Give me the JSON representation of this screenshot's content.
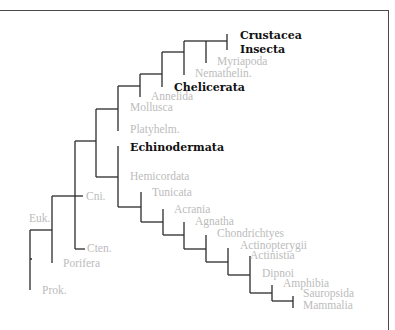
{
  "diagram": {
    "type": "phylogenetic-tree",
    "colors": {
      "line": "#2b2b2b",
      "highlight_label": "#111111",
      "faded_label": "#bcbcbc",
      "frame": "#4a4a4a"
    },
    "labels": [
      {
        "id": "crustacea",
        "text": "Crustacea",
        "x": 240,
        "y": 35,
        "bold": true
      },
      {
        "id": "insecta",
        "text": "Insecta",
        "x": 240,
        "y": 49,
        "bold": true
      },
      {
        "id": "myriapoda",
        "text": "Myriapoda",
        "x": 217,
        "y": 62,
        "bold": false
      },
      {
        "id": "nemathelin",
        "text": "Nemathelin.",
        "x": 195,
        "y": 74,
        "bold": false
      },
      {
        "id": "chelicerata",
        "text": "Chelicerata",
        "x": 174,
        "y": 87,
        "bold": true
      },
      {
        "id": "annelida",
        "text": "Annelida",
        "x": 151,
        "y": 97,
        "bold": false
      },
      {
        "id": "mollusca",
        "text": "Mollusca",
        "x": 130,
        "y": 108,
        "bold": false
      },
      {
        "id": "platyhelm",
        "text": "Platyhelm.",
        "x": 130,
        "y": 130,
        "bold": false
      },
      {
        "id": "echinodermata",
        "text": "Echinodermata",
        "x": 130,
        "y": 147,
        "bold": true
      },
      {
        "id": "hemicordata",
        "text": "Hemicordata",
        "x": 130,
        "y": 177,
        "bold": false
      },
      {
        "id": "tunicata",
        "text": "Tunicata",
        "x": 152,
        "y": 193,
        "bold": false
      },
      {
        "id": "acrania",
        "text": "Acrania",
        "x": 174,
        "y": 210,
        "bold": false
      },
      {
        "id": "agnatha",
        "text": "Agnatha",
        "x": 195,
        "y": 222,
        "bold": false
      },
      {
        "id": "chondrichtyes",
        "text": "Chondrichtyes",
        "x": 217,
        "y": 234,
        "bold": false
      },
      {
        "id": "actinopterygii",
        "text": "Actinopterygii",
        "x": 240,
        "y": 246,
        "bold": false
      },
      {
        "id": "actinistia",
        "text": "Actinistia",
        "x": 250,
        "y": 256,
        "bold": false
      },
      {
        "id": "dipnoi",
        "text": "Dipnoi",
        "x": 262,
        "y": 274,
        "bold": false
      },
      {
        "id": "amphibia",
        "text": "Amphibia",
        "x": 283,
        "y": 284,
        "bold": false
      },
      {
        "id": "sauropsida",
        "text": "Sauropsida",
        "x": 303,
        "y": 294,
        "bold": false
      },
      {
        "id": "mammalia",
        "text": "Mammalia",
        "x": 303,
        "y": 306,
        "bold": false
      },
      {
        "id": "cni",
        "text": "Cni.",
        "x": 86,
        "y": 197,
        "bold": false
      },
      {
        "id": "euk",
        "text": "Euk.",
        "x": 29,
        "y": 219,
        "bold": false
      },
      {
        "id": "cten",
        "text": "Cten.",
        "x": 87,
        "y": 249,
        "bold": false
      },
      {
        "id": "porifera",
        "text": "Porifera",
        "x": 63,
        "y": 264,
        "bold": false
      },
      {
        "id": "prok",
        "text": "Prok.",
        "x": 42,
        "y": 291,
        "bold": false
      }
    ],
    "segments": [
      [
        30,
        230,
        30,
        290
      ],
      [
        30,
        259,
        32,
        259
      ],
      [
        30,
        230,
        52,
        230
      ],
      [
        52,
        196,
        52,
        263
      ],
      [
        52,
        196,
        83,
        196
      ],
      [
        75,
        141,
        75,
        249
      ],
      [
        75,
        249,
        85,
        249
      ],
      [
        75,
        141,
        96,
        141
      ],
      [
        96,
        109,
        96,
        177
      ],
      [
        96,
        109,
        118,
        109
      ],
      [
        118,
        86,
        118,
        131
      ],
      [
        96,
        177,
        118,
        177
      ],
      [
        118,
        146,
        118,
        207
      ],
      [
        118,
        86,
        140,
        86
      ],
      [
        140,
        74,
        140,
        97
      ],
      [
        140,
        74,
        162,
        74
      ],
      [
        162,
        52,
        162,
        87
      ],
      [
        162,
        52,
        184,
        52
      ],
      [
        184,
        41,
        184,
        75
      ],
      [
        184,
        41,
        206,
        41
      ],
      [
        206,
        41,
        206,
        63
      ],
      [
        206,
        41,
        227,
        41
      ],
      [
        227,
        34,
        227,
        50
      ],
      [
        118,
        207,
        141,
        207
      ],
      [
        141,
        192,
        141,
        222
      ],
      [
        141,
        222,
        163,
        222
      ],
      [
        163,
        209,
        163,
        235
      ],
      [
        163,
        235,
        184,
        235
      ],
      [
        184,
        222,
        184,
        249
      ],
      [
        184,
        249,
        206,
        249
      ],
      [
        206,
        235,
        206,
        262
      ],
      [
        206,
        262,
        228,
        262
      ],
      [
        228,
        248,
        228,
        275
      ],
      [
        228,
        275,
        250,
        275
      ],
      [
        250,
        256,
        250,
        293
      ],
      [
        250,
        293,
        272,
        293
      ],
      [
        272,
        285,
        272,
        301
      ],
      [
        272,
        301,
        293,
        301
      ],
      [
        293,
        296,
        293,
        308
      ]
    ]
  }
}
